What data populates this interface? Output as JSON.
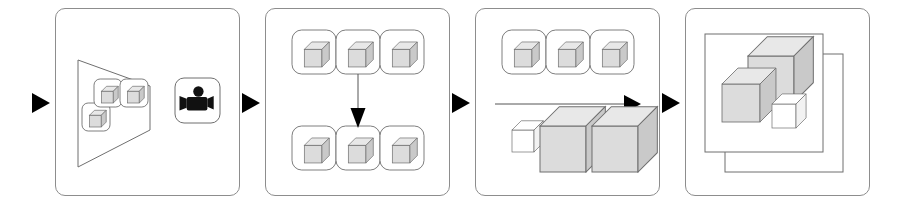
{
  "figure": {
    "kind": "pipeline-diagram",
    "description": "Four-stage 3D reconstruction pipeline diagram with black triangular flow arrows between panels",
    "background_color": "#ffffff",
    "panel_border_color": "#8d8d8d",
    "arrow_color": "#000000",
    "cube_top_color": "#e8e8e8",
    "cube_front_color": "#dcdcdc",
    "cube_side_color": "#c9c9c9",
    "cube_white_color": "#ffffff",
    "stroke_color": "#6f6f6f"
  },
  "panels": [
    {
      "id": "panel-capture",
      "name": "capture-stage",
      "x": 55,
      "y": 8,
      "width": 185,
      "height": 188,
      "contents": {
        "frustum": {
          "name": "camera-frustum",
          "points": "78,60 78,167 150,130 150,86"
        },
        "camera_icon": {
          "name": "movie-camera-icon",
          "box_x": 175,
          "box_y": 78,
          "box_size": 45
        },
        "object_tiles": [
          {
            "name": "object-tile-1",
            "x": 82,
            "y": 103,
            "size": 28
          },
          {
            "name": "object-tile-2",
            "x": 94,
            "y": 79,
            "size": 28
          },
          {
            "name": "object-tile-3",
            "x": 120,
            "y": 79,
            "size": 28
          }
        ]
      }
    },
    {
      "id": "panel-match",
      "name": "matching-stage",
      "x": 265,
      "y": 8,
      "width": 185,
      "height": 188,
      "contents": {
        "top_row_tiles": [
          {
            "name": "match-tile-top-1",
            "x": 292,
            "y": 30,
            "size": 44
          },
          {
            "name": "match-tile-top-2",
            "x": 336,
            "y": 30,
            "size": 44
          },
          {
            "name": "match-tile-top-3",
            "x": 380,
            "y": 30,
            "size": 44
          }
        ],
        "bottom_row_tiles": [
          {
            "name": "match-tile-bottom-1",
            "x": 292,
            "y": 126,
            "size": 44
          },
          {
            "name": "match-tile-bottom-2",
            "x": 336,
            "y": 126,
            "size": 44
          },
          {
            "name": "match-tile-bottom-3",
            "x": 380,
            "y": 126,
            "size": 44
          }
        ],
        "down_arrow": {
          "name": "downward-flow-arrow",
          "x": 358,
          "y_start": 74,
          "y_end": 126
        }
      }
    },
    {
      "id": "panel-reconstruct",
      "name": "reconstruction-stage",
      "x": 475,
      "y": 8,
      "width": 185,
      "height": 188,
      "contents": {
        "input_tiles": [
          {
            "name": "recon-tile-1",
            "x": 502,
            "y": 30,
            "size": 44
          },
          {
            "name": "recon-tile-2",
            "x": 546,
            "y": 30,
            "size": 44
          },
          {
            "name": "recon-tile-3",
            "x": 590,
            "y": 30,
            "size": 44
          }
        ],
        "right_arrow": {
          "name": "rightward-flow-arrow",
          "y": 104,
          "x_start": 495,
          "x_end": 640
        },
        "output_cubes": [
          {
            "name": "output-cube-small",
            "x": 512,
            "y": 130,
            "size": 22,
            "fill": "white"
          },
          {
            "name": "output-cube-large-1",
            "x": 540,
            "y": 126,
            "size": 46,
            "fill": "gray"
          },
          {
            "name": "output-cube-large-2",
            "x": 592,
            "y": 126,
            "size": 46,
            "fill": "gray"
          }
        ]
      }
    },
    {
      "id": "panel-scene",
      "name": "scene-output-stage",
      "x": 685,
      "y": 8,
      "width": 185,
      "height": 188,
      "contents": {
        "back_frame": {
          "name": "back-frame-rect",
          "x": 725,
          "y": 54,
          "width": 118,
          "height": 118
        },
        "front_frame": {
          "name": "front-frame-rect",
          "x": 705,
          "y": 34,
          "width": 118,
          "height": 118
        },
        "scene_cubes": [
          {
            "name": "scene-cube-large",
            "x": 748,
            "y": 56,
            "size": 46,
            "fill": "gray"
          },
          {
            "name": "scene-cube-medium",
            "x": 722,
            "y": 84,
            "size": 38,
            "fill": "gray"
          },
          {
            "name": "scene-cube-small",
            "x": 772,
            "y": 104,
            "size": 24,
            "fill": "white"
          }
        ]
      }
    }
  ],
  "flow_arrows": [
    {
      "name": "flow-arrow-1",
      "x": 32,
      "y": 93,
      "width": 18,
      "height": 20
    },
    {
      "name": "flow-arrow-2",
      "x": 242,
      "y": 93,
      "width": 18,
      "height": 20
    },
    {
      "name": "flow-arrow-3",
      "x": 452,
      "y": 93,
      "width": 18,
      "height": 20
    },
    {
      "name": "flow-arrow-4",
      "x": 662,
      "y": 93,
      "width": 18,
      "height": 20
    }
  ]
}
